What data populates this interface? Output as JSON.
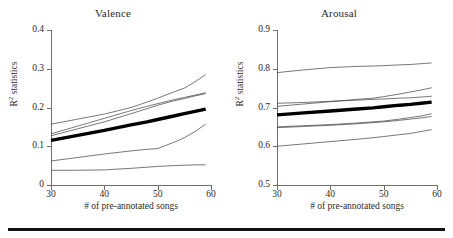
{
  "figure": {
    "bottom_rule": "horizontal-rule",
    "line_color": "#3d3d3d",
    "mean_line_color": "#000000",
    "axis_color": "#6e6e6e"
  },
  "axis_titles": {
    "x": "# of pre-annotated songs",
    "y_prefix": "R",
    "y_superscript": "2",
    "y_suffix": " statistics"
  },
  "chart_data": [
    {
      "type": "line",
      "title": "Valence",
      "xlabel": "# of pre-annotated songs",
      "ylabel": "R2 statistics",
      "xlim": [
        30,
        60
      ],
      "ylim": [
        0,
        0.4
      ],
      "xticks": [
        30,
        40,
        50,
        60
      ],
      "xtick_labels": [
        "30",
        "40",
        "50",
        "60"
      ],
      "yticks": [
        0,
        0.1,
        0.2,
        0.3,
        0.4
      ],
      "ytick_labels": [
        "0",
        "0.1",
        "0.2",
        "0.3",
        "0.4"
      ],
      "grid": false,
      "legend": "none",
      "x": [
        30,
        35,
        40,
        45,
        48,
        50,
        53,
        55,
        57,
        59
      ],
      "series": [
        {
          "name": "mean",
          "emphasis": "thick",
          "values": [
            0.115,
            0.128,
            0.141,
            0.155,
            0.163,
            0.169,
            0.178,
            0.184,
            0.19,
            0.196
          ]
        },
        {
          "name": "fold-upper-1",
          "emphasis": "thin",
          "values": [
            0.157,
            0.17,
            0.183,
            0.2,
            0.214,
            0.224,
            0.24,
            0.25,
            0.266,
            0.285
          ]
        },
        {
          "name": "fold-upper-2",
          "emphasis": "thin",
          "values": [
            0.132,
            0.152,
            0.172,
            0.192,
            0.203,
            0.21,
            0.22,
            0.226,
            0.232,
            0.238
          ]
        },
        {
          "name": "fold-upper-3",
          "emphasis": "thin",
          "values": [
            0.127,
            0.145,
            0.163,
            0.184,
            0.197,
            0.206,
            0.217,
            0.223,
            0.23,
            0.236
          ]
        },
        {
          "name": "fold-lower-1",
          "emphasis": "thin",
          "values": [
            0.062,
            0.071,
            0.08,
            0.088,
            0.092,
            0.094,
            0.11,
            0.122,
            0.138,
            0.157
          ]
        },
        {
          "name": "fold-lower-2",
          "emphasis": "thin",
          "values": [
            0.038,
            0.038,
            0.039,
            0.043,
            0.046,
            0.048,
            0.05,
            0.051,
            0.052,
            0.052
          ]
        }
      ]
    },
    {
      "type": "line",
      "title": "Arousal",
      "xlabel": "# of pre-annotated songs",
      "ylabel": "R2 statistics",
      "xlim": [
        30,
        60
      ],
      "ylim": [
        0.5,
        0.9
      ],
      "xticks": [
        30,
        40,
        50,
        60
      ],
      "xtick_labels": [
        "30",
        "40",
        "50",
        "60"
      ],
      "yticks": [
        0.5,
        0.6,
        0.7,
        0.8,
        0.9
      ],
      "ytick_labels": [
        "0.5",
        "0.6",
        "0.7",
        "0.8",
        "0.9"
      ],
      "grid": false,
      "legend": "none",
      "x": [
        30,
        35,
        40,
        45,
        48,
        50,
        53,
        55,
        57,
        59
      ],
      "series": [
        {
          "name": "mean",
          "emphasis": "thick",
          "values": [
            0.681,
            0.686,
            0.691,
            0.696,
            0.699,
            0.702,
            0.706,
            0.708,
            0.711,
            0.714
          ]
        },
        {
          "name": "fold-upper-1",
          "emphasis": "thin",
          "values": [
            0.79,
            0.797,
            0.803,
            0.806,
            0.807,
            0.808,
            0.81,
            0.811,
            0.813,
            0.815
          ]
        },
        {
          "name": "fold-upper-2",
          "emphasis": "thin",
          "values": [
            0.711,
            0.713,
            0.716,
            0.719,
            0.721,
            0.722,
            0.724,
            0.725,
            0.727,
            0.729
          ]
        },
        {
          "name": "fold-upper-3",
          "emphasis": "thin",
          "values": [
            0.703,
            0.709,
            0.715,
            0.721,
            0.724,
            0.728,
            0.735,
            0.74,
            0.745,
            0.751
          ]
        },
        {
          "name": "fold-lower-1",
          "emphasis": "thin",
          "values": [
            0.65,
            0.653,
            0.656,
            0.66,
            0.663,
            0.665,
            0.67,
            0.674,
            0.678,
            0.684
          ]
        },
        {
          "name": "fold-lower-2",
          "emphasis": "thin",
          "values": [
            0.648,
            0.651,
            0.654,
            0.658,
            0.661,
            0.663,
            0.667,
            0.67,
            0.673,
            0.677
          ]
        },
        {
          "name": "fold-lower-3",
          "emphasis": "thin",
          "values": [
            0.6,
            0.606,
            0.612,
            0.618,
            0.622,
            0.625,
            0.63,
            0.633,
            0.638,
            0.643
          ]
        }
      ]
    }
  ]
}
